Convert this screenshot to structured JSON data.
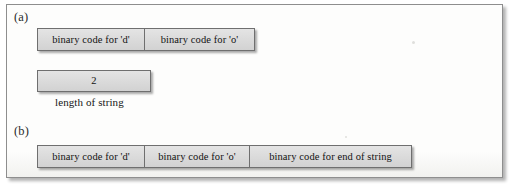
{
  "figure": {
    "panels": [
      {
        "label": "(a)",
        "rows": [
          {
            "name": "string-characters-row",
            "cells": [
              "binary code for 'd'",
              "binary code for 'o'"
            ]
          },
          {
            "name": "string-length-row",
            "cells": [
              "2"
            ]
          }
        ],
        "caption": "length of string"
      },
      {
        "label": "(b)",
        "rows": [
          {
            "name": "string-characters-row",
            "cells": [
              "binary code for 'd'",
              "binary code for 'o'",
              "binary code for end of string"
            ]
          }
        ]
      }
    ]
  },
  "colors": {
    "cell_fill": "#dadada",
    "cell_border": "#6f6f6f",
    "frame_border": "#8e8e8e",
    "page_background": "#ffffff",
    "text": "#121212"
  }
}
